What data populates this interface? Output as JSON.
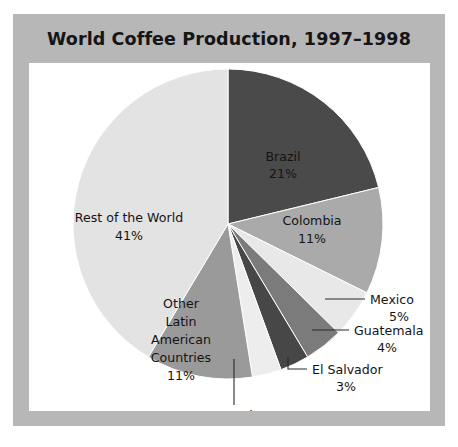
{
  "chart_data": {
    "type": "pie",
    "title": "World Coffee Production, 1997–1998",
    "xlabel": "",
    "ylabel": "",
    "legend": "none",
    "grid": false,
    "total_percent": 99,
    "start_angle_deg": 0,
    "direction": "clockwise",
    "categories": [
      "Brazil",
      "Colombia",
      "Mexico",
      "Guatemala",
      "El Salvador",
      "Costa Rica",
      "Other Latin American Countries",
      "Rest of the World"
    ],
    "values": [
      21,
      11,
      5,
      4,
      3,
      3,
      11,
      41
    ],
    "value_labels": [
      "21%",
      "11%",
      "5%",
      "4%",
      "3%",
      "3%",
      "11%",
      "41%"
    ],
    "colors": [
      "#4a4a4a",
      "#aaaaaa",
      "#e8e8e8",
      "#7b7b7b",
      "#474747",
      "#ededed",
      "#9a9a9a",
      "#e3e3e3"
    ],
    "slices": [
      {
        "name": "Brazil",
        "value": 21,
        "value_label": "21%",
        "color": "#4a4a4a",
        "label_placement": "inside"
      },
      {
        "name": "Colombia",
        "value": 11,
        "value_label": "11%",
        "color": "#aaaaaa",
        "label_placement": "inside"
      },
      {
        "name": "Mexico",
        "value": 5,
        "value_label": "5%",
        "color": "#e8e8e8",
        "label_placement": "callout-right"
      },
      {
        "name": "Guatemala",
        "value": 4,
        "value_label": "4%",
        "color": "#7b7b7b",
        "label_placement": "callout-right"
      },
      {
        "name": "El Salvador",
        "value": 3,
        "value_label": "3%",
        "color": "#474747",
        "label_placement": "callout-right-elbow"
      },
      {
        "name": "Costa Rica",
        "value": 3,
        "value_label": "3%",
        "color": "#ededed",
        "label_placement": "callout-below"
      },
      {
        "name": "Other Latin American Countries",
        "value": 11,
        "value_label": "11%",
        "color": "#9a9a9a",
        "label_placement": "inside-multiline",
        "label_lines": [
          "Other",
          "Latin",
          "American",
          "Countries"
        ]
      },
      {
        "name": "Rest of the World",
        "value": 41,
        "value_label": "41%",
        "color": "#e3e3e3",
        "label_placement": "inside"
      }
    ]
  },
  "figure": {
    "frame_color": "#b7b7b7",
    "canvas_color": "#ffffff",
    "title_color": "#151515"
  },
  "labels": {
    "brazil_name": "Brazil",
    "brazil_value": "21%",
    "colombia_name": "Colombia",
    "colombia_value": "11%",
    "mexico_name": "Mexico",
    "mexico_value": "5%",
    "guatemala_name": "Guatemala",
    "guatemala_value": "4%",
    "elsalvador_name": "El Salvador",
    "elsalvador_value": "3%",
    "costarica_name": "Costa Rica",
    "costarica_value": "3%",
    "other_line1": "Other",
    "other_line2": "Latin",
    "other_line3": "American",
    "other_line4": "Countries",
    "other_value": "11%",
    "rest_name": "Rest of the World",
    "rest_value": "41%"
  }
}
